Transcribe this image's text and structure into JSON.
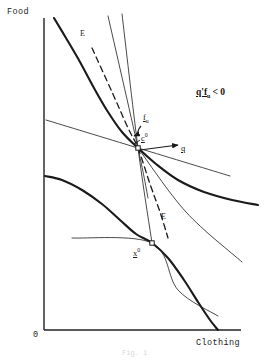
{
  "figure": {
    "caption": "Fig. 1",
    "background": "#ffffff",
    "ink": "#1a1a1a"
  },
  "axes": {
    "y_label": "Food",
    "x_label": "Clothing",
    "origin_label": "0",
    "x_range": [
      0,
      279
    ],
    "y_range": [
      0,
      364
    ],
    "origin_px": [
      44,
      330
    ],
    "y_axis_top_px": [
      44,
      18
    ],
    "x_axis_right_px": [
      241,
      330
    ]
  },
  "labels": {
    "e_upper": "E",
    "e_lower": "E",
    "f_u_vector": "f",
    "f_u_subscript": "u",
    "c_point": "c",
    "c_point_superscript": "0",
    "x_point": "x",
    "x_point_superscript": "0",
    "q_vector": "q",
    "condition": "q'f",
    "condition_subscript": "u",
    "condition_tail": "< 0"
  },
  "chart_data": {
    "type": "line",
    "xlabel": "Clothing",
    "ylabel": "Food",
    "grid": false,
    "legend": null,
    "xlim": [
      0,
      279
    ],
    "ylim": [
      0,
      364
    ],
    "annotations": [
      {
        "text": "E",
        "x": 82,
        "y": 35,
        "kind": "curve-label"
      },
      {
        "text": "E",
        "x": 163,
        "y": 218,
        "kind": "curve-label"
      },
      {
        "text": "f_u",
        "x": 143,
        "y": 119,
        "kind": "vector-label"
      },
      {
        "text": "c^0",
        "x": 143,
        "y": 137,
        "kind": "point-label"
      },
      {
        "text": "q",
        "x": 182,
        "y": 150,
        "kind": "vector-label"
      },
      {
        "text": "x^0",
        "x": 136,
        "y": 253,
        "kind": "point-label"
      },
      {
        "text": "q'f_u < 0",
        "x": 196,
        "y": 95,
        "kind": "condition"
      }
    ],
    "points": [
      {
        "name": "c0-tangency",
        "x": 138,
        "y": 148,
        "marker": "square"
      },
      {
        "name": "x0-production",
        "x": 152,
        "y": 243,
        "marker": "square"
      }
    ],
    "series": [
      {
        "name": "indifference-curve-thick",
        "role": "indifference curve through c0",
        "width": 2.1,
        "style": "solid",
        "points": [
          [
            54,
            18
          ],
          [
            66,
            38
          ],
          [
            80,
            62
          ],
          [
            94,
            88
          ],
          [
            108,
            112
          ],
          [
            122,
            132
          ],
          [
            138,
            148
          ],
          [
            156,
            164
          ],
          [
            178,
            180
          ],
          [
            204,
            192
          ],
          [
            232,
            200
          ],
          [
            258,
            205
          ]
        ]
      },
      {
        "name": "production-frontier-thick",
        "role": "production possibility frontier through x0",
        "width": 2.1,
        "style": "solid",
        "points": [
          [
            45,
            176
          ],
          [
            62,
            180
          ],
          [
            82,
            190
          ],
          [
            102,
            204
          ],
          [
            120,
            220
          ],
          [
            136,
            234
          ],
          [
            152,
            243
          ],
          [
            168,
            258
          ],
          [
            184,
            280
          ],
          [
            198,
            302
          ],
          [
            210,
            320
          ],
          [
            218,
            330
          ]
        ]
      },
      {
        "name": "budget-line-upper-left",
        "role": "price line tangent at c0 (upper-left ray)",
        "width": 0.8,
        "style": "solid",
        "points": [
          [
            46,
            120
          ],
          [
            138,
            148
          ],
          [
            230,
            176
          ]
        ]
      },
      {
        "name": "price-ray-steep-a",
        "role": "steep thin ray through c0",
        "width": 0.8,
        "style": "solid",
        "points": [
          [
            108,
            16
          ],
          [
            138,
            148
          ],
          [
            148,
            198
          ]
        ]
      },
      {
        "name": "price-ray-steep-b",
        "role": "steep thin ray through c0 to x0 region",
        "width": 0.8,
        "style": "solid",
        "points": [
          [
            122,
            14
          ],
          [
            138,
            148
          ],
          [
            152,
            243
          ]
        ]
      },
      {
        "name": "price-ray-through-c0-down-right",
        "role": "thin line from c0 down to the right",
        "width": 0.8,
        "style": "solid",
        "points": [
          [
            138,
            148
          ],
          [
            186,
            212
          ],
          [
            242,
            262
          ]
        ]
      },
      {
        "name": "price-line-at-x0",
        "role": "thin tangent line at x0 extending lower right",
        "width": 0.8,
        "style": "solid",
        "points": [
          [
            72,
            238
          ],
          [
            152,
            243
          ],
          [
            178,
            290
          ],
          [
            218,
            316
          ]
        ]
      },
      {
        "name": "expansion-path-dashed",
        "role": "dashed expansion path E",
        "width": 1.3,
        "style": "dashed",
        "points": [
          [
            92,
            48
          ],
          [
            112,
            92
          ],
          [
            128,
            128
          ],
          [
            138,
            148
          ],
          [
            150,
            184
          ],
          [
            160,
            212
          ],
          [
            168,
            238
          ]
        ]
      }
    ]
  }
}
